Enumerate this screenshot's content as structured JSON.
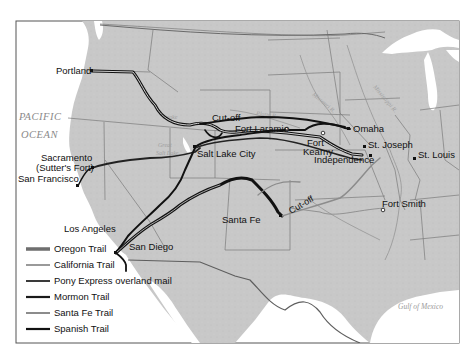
{
  "map": {
    "title": "Western Trails of the United States",
    "water_labels": [
      {
        "id": "pacific",
        "line1": "PACIFIC",
        "line2": "OCEAN"
      },
      {
        "id": "gulf",
        "text": "Gulf of Mexico"
      }
    ],
    "river_labels": [
      {
        "id": "snake",
        "text": "Snake"
      },
      {
        "id": "platte",
        "text": "Platte R."
      },
      {
        "id": "missouri",
        "text": "Missouri R."
      },
      {
        "id": "mississippi",
        "text": "Mississippi R."
      },
      {
        "id": "great-salt-lake",
        "line1": "Great",
        "line2": "Salt Lake"
      }
    ],
    "places": [
      {
        "id": "portland",
        "name": "Portland"
      },
      {
        "id": "sacramento",
        "name": "Sacramento",
        "sub": "(Sutter's Fort)"
      },
      {
        "id": "san-francisco",
        "name": "San Francisco"
      },
      {
        "id": "salt-lake-city",
        "name": "Salt Lake City"
      },
      {
        "id": "los-angeles",
        "name": "Los Angeles"
      },
      {
        "id": "san-diego",
        "name": "San Diego"
      },
      {
        "id": "santa-fe",
        "name": "Santa Fe"
      },
      {
        "id": "fort-laramie",
        "name": "Fort Laramie"
      },
      {
        "id": "fort-kearny",
        "name": "Fort",
        "sub": "Kearny"
      },
      {
        "id": "omaha",
        "name": "Omaha"
      },
      {
        "id": "st-joseph",
        "name": "St. Joseph"
      },
      {
        "id": "independence",
        "name": "Independence"
      },
      {
        "id": "st-louis",
        "name": "St. Louis"
      },
      {
        "id": "fort-smith",
        "name": "Fort Smith"
      }
    ],
    "route_labels": [
      {
        "id": "cutoff-north",
        "text": "Cut-off"
      },
      {
        "id": "cutoff-south",
        "text": "Cut-off"
      }
    ]
  },
  "legend": {
    "items": [
      {
        "label": "Oregon Trail",
        "color": "#5a5a5a",
        "style": "double"
      },
      {
        "label": "California Trail",
        "color": "#9a9a9a",
        "style": "single"
      },
      {
        "label": "Pony Express overland mail",
        "color": "#3a3a3a",
        "style": "single"
      },
      {
        "label": "Mormon Trail",
        "color": "#1a1a1a",
        "style": "single"
      },
      {
        "label": "Santa Fe Trail",
        "color": "#8c8c8c",
        "style": "single"
      },
      {
        "label": "Spanish Trail",
        "color": "#111111",
        "style": "single"
      }
    ]
  },
  "colors": {
    "land": "#c9c9c9",
    "water": "#ffffff",
    "border": "#6e6e6e",
    "trail_dark": "#111111"
  }
}
